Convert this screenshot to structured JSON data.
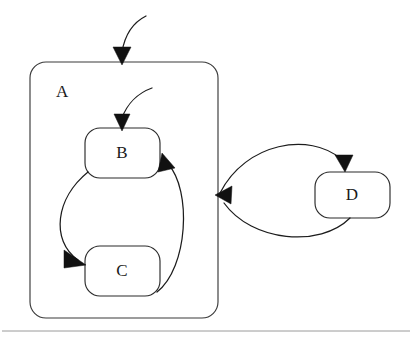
{
  "diagram": {
    "type": "statechart",
    "background_color": "#ffffff",
    "line_color": "#1c1c1c",
    "label_color": "#1a1a1a",
    "composite_states": [
      {
        "id": "A",
        "label": "A",
        "x": 30,
        "y": 62,
        "width": 188,
        "height": 256,
        "corner_radius": 16,
        "label_x": 56,
        "label_y": 93
      }
    ],
    "states": [
      {
        "id": "B",
        "label": "B",
        "x": 85,
        "y": 128,
        "width": 75,
        "height": 50,
        "corner_radius": 15,
        "label_x": 122,
        "label_y": 153
      },
      {
        "id": "C",
        "label": "C",
        "x": 85,
        "y": 246,
        "width": 75,
        "height": 50,
        "corner_radius": 15,
        "label_x": 122,
        "label_y": 271
      },
      {
        "id": "D",
        "label": "D",
        "x": 315,
        "y": 172,
        "width": 75,
        "height": 46,
        "corner_radius": 15,
        "label_x": 352,
        "label_y": 195
      }
    ],
    "transitions": [
      {
        "id": "initial-to-A",
        "name": "initial-transition-into-a",
        "from": "",
        "to": "A",
        "path": "M 146 16 C 134 22 125 34 122 52",
        "arrow_at_x": 122,
        "arrow_at_y": 62,
        "arrow_direction": "down"
      },
      {
        "id": "initial-to-B",
        "name": "initial-transition-into-b",
        "from": "",
        "to": "B",
        "path": "M 152 88 C 138 93 127 104 122 118",
        "arrow_at_x": 122,
        "arrow_at_y": 128,
        "arrow_direction": "down"
      },
      {
        "id": "B-to-C",
        "name": "transition-b-to-c",
        "from": "B",
        "to": "C",
        "path": "M 88 172 C 58 196 52 238 76 258",
        "arrow_at_x": 85,
        "arrow_at_y": 262,
        "arrow_direction": "down-right"
      },
      {
        "id": "C-to-B",
        "name": "transition-c-to-b",
        "from": "C",
        "to": "B",
        "path": "M 157 290 C 186 268 190 192 168 164",
        "arrow_at_x": 164,
        "arrow_at_y": 158,
        "arrow_direction": "up-left"
      },
      {
        "id": "A-to-D",
        "name": "transition-a-to-d",
        "from": "A",
        "to": "D",
        "path": "M 220 192 C 248 142 310 134 343 160",
        "arrow_at_x": 345,
        "arrow_at_y": 170,
        "arrow_direction": "down"
      },
      {
        "id": "D-to-A",
        "name": "transition-d-to-a",
        "from": "D",
        "to": "A",
        "path": "M 348 218 C 318 246 252 240 222 202",
        "arrow_at_x": 217,
        "arrow_at_y": 196,
        "arrow_direction": "left"
      }
    ],
    "footer_rule": {
      "x1": 2,
      "y1": 331,
      "x2": 410,
      "y2": 331
    }
  }
}
